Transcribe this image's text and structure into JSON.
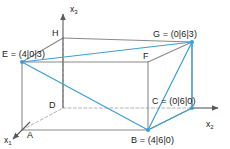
{
  "figure": {
    "type": "3d-cuboid-diagram",
    "background_color": "#ffffff",
    "edge_color": "#8a8a8a",
    "hidden_edge_color": "#b4b4b4",
    "highlight_color": "#3a9fd4",
    "axis_color": "#5a5a5a",
    "text_color": "#1a1a1a"
  },
  "axes": [
    {
      "name": "x1",
      "label": "x",
      "sub": "1",
      "label_x": 4,
      "label_y": 136,
      "direction": "down-left"
    },
    {
      "name": "x2",
      "label": "x",
      "sub": "2",
      "label_x": 206,
      "label_y": 120,
      "direction": "right"
    },
    {
      "name": "x3",
      "label": "x",
      "sub": "3",
      "label_x": 70,
      "label_y": 5,
      "direction": "up"
    }
  ],
  "vertices": [
    {
      "id": "A",
      "label": "A",
      "px": 22,
      "py": 130,
      "label_x": 27,
      "label_y": 131,
      "marked": false
    },
    {
      "id": "B",
      "label": "B = (4|6|0)",
      "px": 148,
      "py": 130,
      "label_x": 131,
      "label_y": 136,
      "marked": true
    },
    {
      "id": "C",
      "label": "C = (0|6|0)",
      "px": 192,
      "py": 108,
      "label_x": 152,
      "label_y": 97,
      "marked": true
    },
    {
      "id": "D",
      "label": "D",
      "px": 63,
      "py": 108,
      "label_x": 49,
      "label_y": 101,
      "marked": false
    },
    {
      "id": "E",
      "label": "E = (4|0|3)",
      "px": 22,
      "py": 62,
      "label_x": 2,
      "label_y": 50,
      "marked": true
    },
    {
      "id": "F",
      "label": "F",
      "px": 148,
      "py": 62,
      "label_x": 143,
      "label_y": 52,
      "marked": false
    },
    {
      "id": "G",
      "label": "G = (0|6|3)",
      "px": 192,
      "py": 42,
      "label_x": 153,
      "label_y": 30,
      "marked": true
    },
    {
      "id": "H",
      "label": "H",
      "px": 63,
      "py": 38,
      "label_x": 52,
      "label_y": 29,
      "marked": false
    }
  ],
  "edges_solid": [
    {
      "name": "edge-A-B",
      "from": "A",
      "to": "B"
    },
    {
      "name": "edge-B-C",
      "from": "B",
      "to": "C"
    },
    {
      "name": "edge-A-E",
      "from": "A",
      "to": "E"
    },
    {
      "name": "edge-B-F",
      "from": "B",
      "to": "F"
    },
    {
      "name": "edge-C-G",
      "from": "C",
      "to": "G"
    },
    {
      "name": "edge-E-F",
      "from": "E",
      "to": "F"
    },
    {
      "name": "edge-F-G",
      "from": "F",
      "to": "G"
    },
    {
      "name": "edge-H-G",
      "from": "H",
      "to": "G"
    },
    {
      "name": "edge-E-H",
      "from": "E",
      "to": "H"
    }
  ],
  "edges_hidden": [
    {
      "name": "edge-A-D",
      "from": "A",
      "to": "D"
    },
    {
      "name": "edge-D-C",
      "from": "D",
      "to": "C"
    },
    {
      "name": "edge-D-H",
      "from": "D",
      "to": "H"
    }
  ],
  "edges_highlight": [
    {
      "name": "highlight-edge-E-B",
      "from": "E",
      "to": "B"
    },
    {
      "name": "highlight-edge-E-G",
      "from": "E",
      "to": "G"
    },
    {
      "name": "highlight-edge-B-G",
      "from": "B",
      "to": "G"
    },
    {
      "name": "highlight-edge-B-C",
      "from": "B",
      "to": "C"
    },
    {
      "name": "highlight-edge-C-G",
      "from": "C",
      "to": "G"
    }
  ]
}
